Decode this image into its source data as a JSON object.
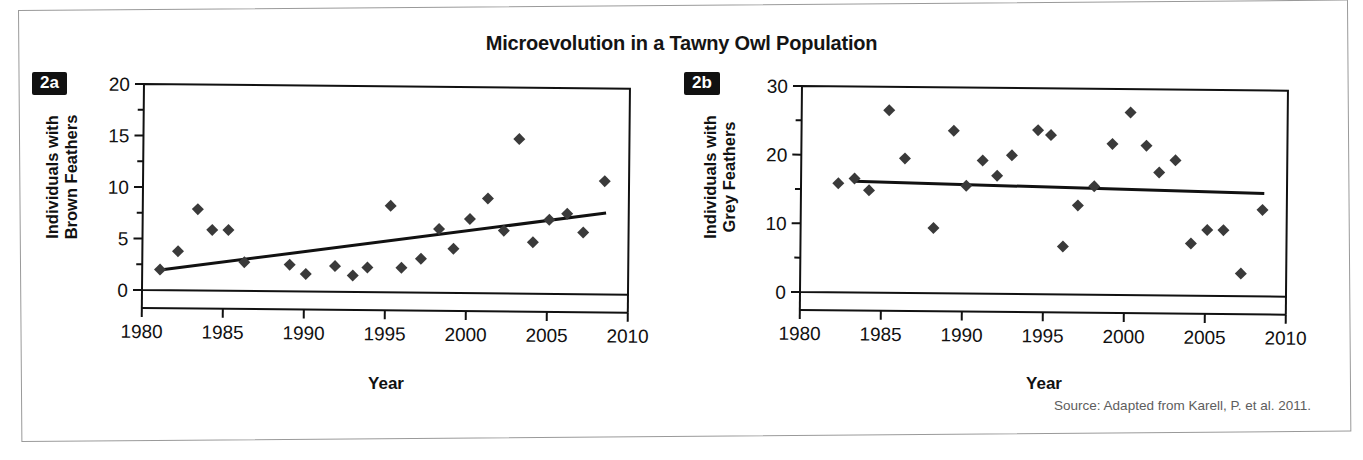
{
  "figure": {
    "title": "Microevolution in a Tawny Owl Population",
    "source_note": "Source: Adapted from Karell, P. et al. 2011."
  },
  "panels": {
    "a": {
      "tag": "2a",
      "ylabel_line1": "Individuals with",
      "ylabel_line2": "Brown Feathers",
      "xlabel": "Year"
    },
    "b": {
      "tag": "2b",
      "ylabel_line1": "Individuals with",
      "ylabel_line2": "Grey Feathers",
      "xlabel": "Year"
    }
  },
  "chart_data": [
    {
      "type": "scatter",
      "id": "2a",
      "title": "Individuals with Brown Feathers",
      "xlabel": "Year",
      "ylabel": "Individuals with Brown Feathers",
      "xlim": [
        1980,
        2010
      ],
      "ylim": [
        0,
        20
      ],
      "xticks": [
        1980,
        1985,
        1990,
        1995,
        2000,
        2005,
        2010
      ],
      "xtick_labels": [
        "1980",
        "1985",
        "1990",
        "1995",
        "2000",
        "2005",
        "2010"
      ],
      "yticks": [
        0,
        5,
        10,
        15,
        20
      ],
      "ytick_labels": [
        "0",
        "5",
        "10",
        "15",
        "20"
      ],
      "yminor_ticks": [
        2.5,
        7.5,
        12.5,
        17.5
      ],
      "grid": false,
      "legend": "none",
      "marker": "diamond",
      "marker_color": "#3a3a3a",
      "x": [
        1981.1,
        1982.2,
        1983.4,
        1984.3,
        1985.3,
        1986.3,
        1989.1,
        1990.1,
        1991.9,
        1993.0,
        1993.9,
        1995.3,
        1996.0,
        1997.2,
        1998.3,
        1999.2,
        2000.2,
        2001.3,
        2002.3,
        2003.2,
        2004.1,
        2005.1,
        2006.2,
        2007.2,
        2008.5
      ],
      "y": [
        2.0,
        3.8,
        7.9,
        5.9,
        5.9,
        2.8,
        2.6,
        1.7,
        2.5,
        1.6,
        2.4,
        8.4,
        2.4,
        3.3,
        6.2,
        4.3,
        7.2,
        9.2,
        6.1,
        15.0,
        5.0,
        7.2,
        7.8,
        6.0,
        11.0
      ],
      "trend_line": {
        "type": "linear",
        "x_start": 1981.1,
        "y_start": 1.95,
        "x_end": 2008.6,
        "y_end": 7.9,
        "color": "#111111"
      }
    },
    {
      "type": "scatter",
      "id": "2b",
      "title": "Individuals with Grey Feathers",
      "xlabel": "Year",
      "ylabel": "Individuals with Grey Feathers",
      "xlim": [
        1980,
        2010
      ],
      "ylim": [
        0,
        30
      ],
      "xticks": [
        1980,
        1985,
        1990,
        1995,
        2000,
        2005,
        2010
      ],
      "xtick_labels": [
        "1980",
        "1985",
        "1990",
        "1995",
        "2000",
        "2005",
        "2010"
      ],
      "yticks": [
        0,
        10,
        20,
        30
      ],
      "ytick_labels": [
        "0",
        "10",
        "20",
        "30"
      ],
      "yminor_ticks": [
        5,
        15,
        25
      ],
      "grid": false,
      "legend": "none",
      "marker": "diamond",
      "marker_color": "#3a3a3a",
      "x": [
        1982.3,
        1983.3,
        1984.2,
        1985.4,
        1986.4,
        1988.2,
        1989.4,
        1990.2,
        1991.2,
        1992.1,
        1993.0,
        1994.6,
        1995.4,
        1996.2,
        1997.1,
        1998.1,
        1999.2,
        2000.3,
        2001.3,
        2002.1,
        2003.1,
        2004.1,
        2005.1,
        2006.1,
        2007.2,
        2008.5
      ],
      "y": [
        15.9,
        16.6,
        14.9,
        26.6,
        19.6,
        9.5,
        23.7,
        15.7,
        19.4,
        17.2,
        20.2,
        23.9,
        23.2,
        7.0,
        13.0,
        15.8,
        22.0,
        26.6,
        21.8,
        17.9,
        19.7,
        7.6,
        9.6,
        9.6,
        3.3,
        12.6
      ],
      "trend_line": {
        "type": "linear",
        "x_start": 1983.3,
        "y_start": 16.2,
        "x_end": 2008.6,
        "y_end": 15.0,
        "color": "#111111"
      }
    }
  ]
}
